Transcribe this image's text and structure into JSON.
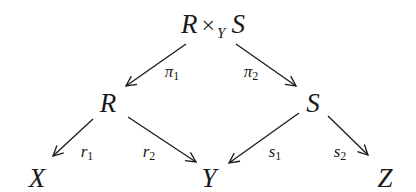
{
  "diagram": {
    "type": "commutative-diagram",
    "nodes": {
      "top": {
        "left": "R",
        "op": "×",
        "sub": "Y",
        "right": "S"
      },
      "R": {
        "label": "R"
      },
      "S": {
        "label": "S"
      },
      "X": {
        "label": "X"
      },
      "Y": {
        "label": "Y"
      },
      "Z": {
        "label": "Z"
      }
    },
    "arrows": {
      "pi1": {
        "base": "π",
        "sub": "1",
        "from": "R ×_Y S",
        "to": "R"
      },
      "pi2": {
        "base": "π",
        "sub": "2",
        "from": "R ×_Y S",
        "to": "S"
      },
      "r1": {
        "base": "r",
        "sub": "1",
        "from": "R",
        "to": "X"
      },
      "r2": {
        "base": "r",
        "sub": "2",
        "from": "R",
        "to": "Y"
      },
      "s1": {
        "base": "s",
        "sub": "1",
        "from": "S",
        "to": "Y"
      },
      "s2": {
        "base": "s",
        "sub": "2",
        "from": "S",
        "to": "Z"
      }
    },
    "colors": {
      "ink": "#1a1a1a",
      "background": "#ffffff"
    }
  }
}
